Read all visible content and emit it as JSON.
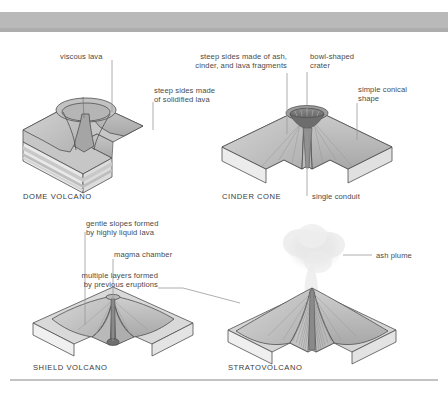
{
  "figure": {
    "title_present": false,
    "background_color": "#ffffff",
    "band_color": "#b9b9b9",
    "line_color": "#8c8c8c",
    "text_color": "#4a4a4a"
  },
  "panels": [
    {
      "id": "dome-volcano",
      "caption": "DOME VOLCANO",
      "labels": [
        {
          "id": "viscous-lava",
          "text": "viscous lava"
        },
        {
          "id": "steep-sides-solidified",
          "text": "steep sides made\nof solidified lava"
        }
      ]
    },
    {
      "id": "cinder-cone",
      "caption": "CINDER CONE",
      "labels": [
        {
          "id": "steep-sides-ash",
          "text": "steep sides made of ash,\ncinder, and lava fragments"
        },
        {
          "id": "bowl-shaped-crater",
          "text": "bowl-shaped\ncrater"
        },
        {
          "id": "simple-conical-shape",
          "text": "simple conical\nshape"
        },
        {
          "id": "single-conduit",
          "text": "single conduit"
        }
      ]
    },
    {
      "id": "shield-volcano",
      "caption": "SHIELD VOLCANO",
      "labels": [
        {
          "id": "gentle-slopes",
          "text": "gentle slopes formed\nby highly liquid lava"
        },
        {
          "id": "magma-chamber",
          "text": "magma chamber"
        }
      ]
    },
    {
      "id": "stratovolcano",
      "caption": "STRATOVOLCANO",
      "labels": [
        {
          "id": "multiple-layers",
          "text": "multiple layers formed\nby previous eruptions"
        },
        {
          "id": "ash-plume",
          "text": "ash plume"
        }
      ]
    }
  ],
  "text": {
    "viscous_lava": "viscous lava",
    "steep_sides_solidified_l1": "steep sides made",
    "steep_sides_solidified_l2": "of solidified lava",
    "steep_sides_ash_l1": "steep sides made of ash,",
    "steep_sides_ash_l2": "cinder, and lava fragments",
    "bowl_crater_l1": "bowl-shaped",
    "bowl_crater_l2": "crater",
    "simple_conical_l1": "simple conical",
    "simple_conical_l2": "shape",
    "single_conduit": "single conduit",
    "gentle_slopes_l1": "gentle slopes formed",
    "gentle_slopes_l2": "by highly liquid lava",
    "magma_chamber": "magma chamber",
    "multiple_layers_l1": "multiple layers formed",
    "multiple_layers_l2": "by previous eruptions",
    "ash_plume": "ash plume",
    "cap_dome": "DOME VOLCANO",
    "cap_cinder": "CINDER CONE",
    "cap_shield": "SHIELD VOLCANO",
    "cap_strato": "STRATOVOLCANO"
  }
}
